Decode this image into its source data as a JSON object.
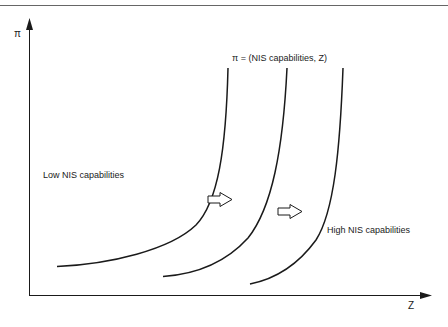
{
  "diagram": {
    "axes": {
      "y_label": "π",
      "x_label": "Z"
    },
    "equation_label": "π = (NIS capabilities, Z)",
    "region_labels": {
      "low": "Low NIS capabilities",
      "high": "High NIS capabilities"
    },
    "curves": [
      {
        "name": "curve-1",
        "description": "leftmost iso-curve"
      },
      {
        "name": "curve-2",
        "description": "middle iso-curve"
      },
      {
        "name": "curve-3",
        "description": "rightmost iso-curve"
      }
    ],
    "shift_arrows": [
      {
        "name": "shift-arrow-1",
        "direction": "right"
      },
      {
        "name": "shift-arrow-2",
        "direction": "right"
      }
    ],
    "colors": {
      "line": "#1a1a1a",
      "rule": "#555555",
      "background": "#ffffff"
    }
  }
}
